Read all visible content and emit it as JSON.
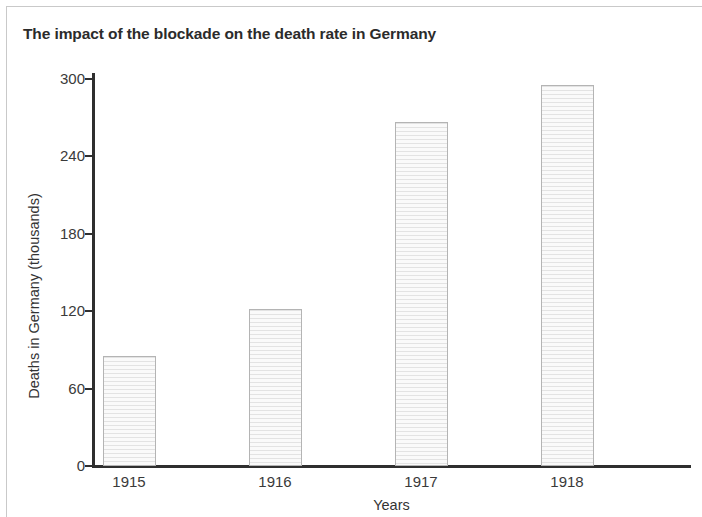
{
  "chart_data": {
    "type": "bar",
    "title": "The impact of the blockade on the death rate in Germany",
    "xlabel": "Years",
    "ylabel": "Deaths in Germany (thousands)",
    "categories": [
      "1915",
      "1916",
      "1917",
      "1918"
    ],
    "values": [
      85,
      122,
      267,
      295
    ],
    "series": [
      {
        "name": "Deaths in Germany (thousands)",
        "values": [
          85,
          122,
          267,
          295
        ]
      }
    ],
    "ylim": [
      0,
      300
    ],
    "yticks": [
      0,
      60,
      120,
      180,
      240,
      300
    ],
    "ytick_labels": [
      "0",
      "60",
      "120",
      "180",
      "240",
      "300"
    ],
    "grid": false,
    "legend": false,
    "legend_position": "none",
    "bar_fill_color": "#f2f2f2",
    "bar_hatch_color": "#e3e3e3",
    "bar_border_color": "#b4b4b4",
    "axis_color": "#2f2f2f",
    "text_color": "#333333",
    "title_color": "#2b2b2b",
    "background_color": "#ffffff"
  }
}
